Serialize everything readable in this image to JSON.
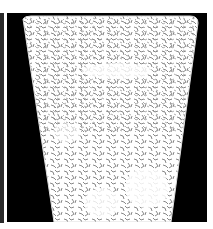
{
  "image": {
    "description": "Edge-detected texture of a tapered vessel on black background",
    "colors": {
      "background": "#ffffff",
      "frame": "#000000",
      "strip": "#2a2a2a",
      "vessel_fill": "#ffffff",
      "texture": "#8a8a8a"
    }
  }
}
